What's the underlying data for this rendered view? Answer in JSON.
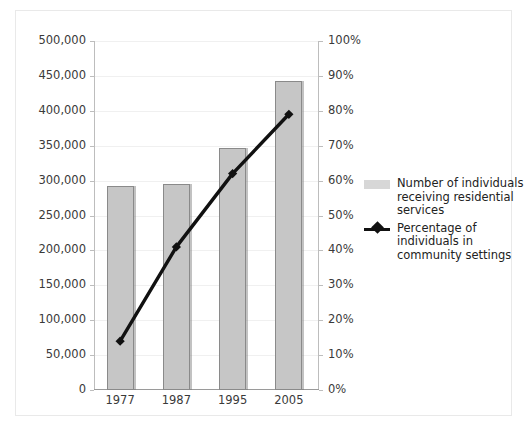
{
  "chart_data": {
    "type": "bar",
    "title": "",
    "subtitle": "",
    "xlabel": "",
    "ylabel": "",
    "y2label": "",
    "categories": [
      "1977",
      "1987",
      "1995",
      "2005"
    ],
    "grid": true,
    "legend_position": "right",
    "axes": {
      "left": {
        "ylim": [
          0,
          500000
        ],
        "ticks": [
          0,
          50000,
          100000,
          150000,
          200000,
          250000,
          300000,
          350000,
          400000,
          450000,
          500000
        ],
        "tick_labels": [
          "0",
          "50,000",
          "100,000",
          "150,000",
          "200,000",
          "250,000",
          "300,000",
          "350,000",
          "400,000",
          "450,000",
          "500,000"
        ]
      },
      "right": {
        "ylim": [
          0,
          100
        ],
        "ticks": [
          0,
          10,
          20,
          30,
          40,
          50,
          60,
          70,
          80,
          90,
          100
        ],
        "tick_labels": [
          "0%",
          "10%",
          "20%",
          "30%",
          "40%",
          "50%",
          "60%",
          "70%",
          "80%",
          "90%",
          "100%"
        ]
      }
    },
    "series": [
      {
        "name": "Number of individuals receiving residential services",
        "type": "bar",
        "axis": "left",
        "color": "#c6c6c6",
        "edge_color": "#8a8a8a",
        "values": [
          292000,
          295000,
          347000,
          443000
        ]
      },
      {
        "name": "Percentage of individuals in community settings",
        "type": "line",
        "axis": "right",
        "color": "#111111",
        "marker": "diamond",
        "values": [
          14,
          41,
          62,
          79
        ]
      }
    ]
  },
  "legend": {
    "items": [
      {
        "key": "bar-swatch",
        "label": "Number of individuals receiving residential services"
      },
      {
        "key": "line-diamond",
        "label": "Percentage of individuals in community settings"
      }
    ]
  }
}
